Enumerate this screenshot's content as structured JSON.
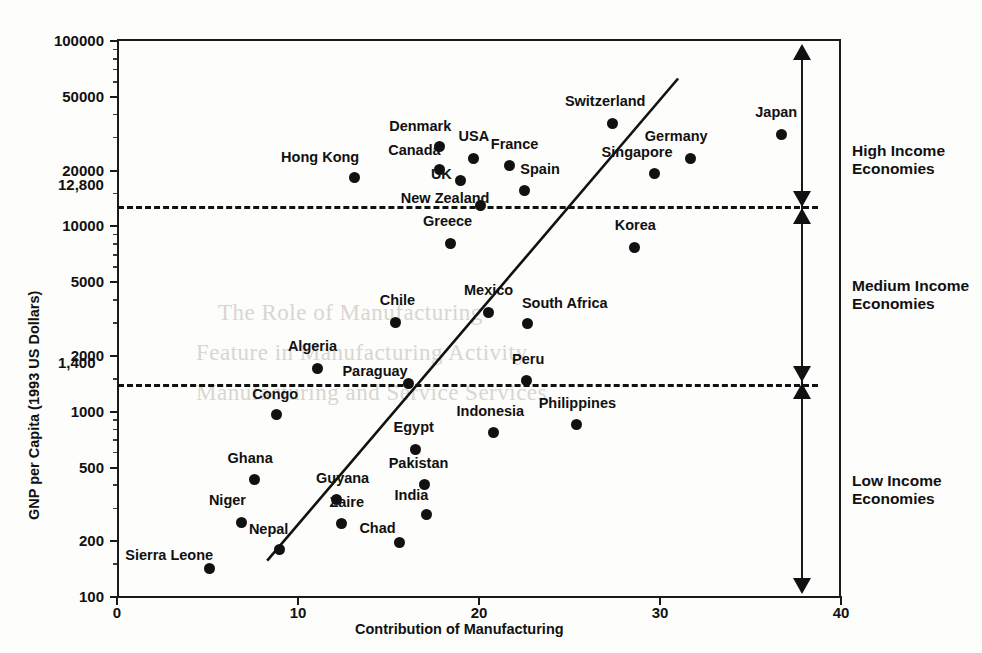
{
  "chart_data": {
    "type": "scatter",
    "title": "",
    "xlabel": "Contribution of Manufacturing",
    "ylabel": "GNP per Capita (1993 US Dollars)",
    "x_ticks": [
      "0",
      "10",
      "20",
      "30",
      "40"
    ],
    "x_tick_values": [
      0,
      10,
      20,
      30,
      40
    ],
    "xlim": [
      0,
      40
    ],
    "y_scale": "log",
    "y_ticks": [
      "100",
      "200",
      "500",
      "1000",
      "2000",
      "5000",
      "10000",
      "20000",
      "50000",
      "100000"
    ],
    "y_tick_values": [
      100,
      200,
      500,
      1000,
      2000,
      5000,
      10000,
      20000,
      50000,
      100000
    ],
    "ylim": [
      100,
      100000
    ],
    "grid": false,
    "legend": "none",
    "threshold_lines": [
      {
        "label": "12,800",
        "value": 12800
      },
      {
        "label": "1,400",
        "value": 1400
      }
    ],
    "trendline": {
      "x0": 8.3,
      "y0": 155,
      "x1": 31.0,
      "y1": 62000
    },
    "points": [
      {
        "label": "Japan",
        "x": 36.7,
        "y": 31000,
        "lx": -26,
        "ly": -22
      },
      {
        "label": "Switzerland",
        "x": 27.4,
        "y": 35500,
        "lx": -48,
        "ly": -22
      },
      {
        "label": "Germany",
        "x": 31.7,
        "y": 23000,
        "lx": -46,
        "ly": -22
      },
      {
        "label": "Singapore",
        "x": 29.7,
        "y": 19000,
        "lx": -53,
        "ly": -22
      },
      {
        "label": "Denmark",
        "x": 17.8,
        "y": 26500,
        "lx": -50,
        "ly": -21
      },
      {
        "label": "USA",
        "x": 19.7,
        "y": 23000,
        "lx": -15,
        "ly": -22
      },
      {
        "label": "France",
        "x": 21.7,
        "y": 21000,
        "lx": -19,
        "ly": -22
      },
      {
        "label": "Canada",
        "x": 17.8,
        "y": 20000,
        "lx": -51,
        "ly": -20
      },
      {
        "label": "UK",
        "x": 19.0,
        "y": 17500,
        "lx": -30,
        "ly": -6
      },
      {
        "label": "Spain",
        "x": 22.5,
        "y": 15500,
        "lx": -4,
        "ly": -21
      },
      {
        "label": "Hong Kong",
        "x": 13.1,
        "y": 18200,
        "lx": -73,
        "ly": -20
      },
      {
        "label": "New Zealand",
        "x": 20.1,
        "y": 12800,
        "lx": -80,
        "ly": -8
      },
      {
        "label": "Korea",
        "x": 28.6,
        "y": 7600,
        "lx": -20,
        "ly": -22
      },
      {
        "label": "Greece",
        "x": 18.4,
        "y": 8000,
        "lx": -27,
        "ly": -22
      },
      {
        "label": "Mexico",
        "x": 20.5,
        "y": 3400,
        "lx": -24,
        "ly": -22
      },
      {
        "label": "South Africa",
        "x": 22.7,
        "y": 2950,
        "lx": -6,
        "ly": -21
      },
      {
        "label": "Chile",
        "x": 15.4,
        "y": 3000,
        "lx": -16,
        "ly": -22
      },
      {
        "label": "Algeria",
        "x": 11.1,
        "y": 1700,
        "lx": -30,
        "ly": -22
      },
      {
        "label": "Peru",
        "x": 22.6,
        "y": 1450,
        "lx": -14,
        "ly": -22
      },
      {
        "label": "Paraguay",
        "x": 16.1,
        "y": 1400,
        "lx": -66,
        "ly": -13
      },
      {
        "label": "Congo",
        "x": 8.8,
        "y": 950,
        "lx": -24,
        "ly": -21
      },
      {
        "label": "Philippines",
        "x": 25.4,
        "y": 840,
        "lx": -38,
        "ly": -22
      },
      {
        "label": "Indonesia",
        "x": 20.8,
        "y": 760,
        "lx": -37,
        "ly": -22
      },
      {
        "label": "Egypt",
        "x": 16.5,
        "y": 620,
        "lx": -22,
        "ly": -22
      },
      {
        "label": "Ghana",
        "x": 7.6,
        "y": 425,
        "lx": -27,
        "ly": -22
      },
      {
        "label": "Pakistan",
        "x": 17.0,
        "y": 400,
        "lx": -36,
        "ly": -21
      },
      {
        "label": "Guyana",
        "x": 12.1,
        "y": 330,
        "lx": -20,
        "ly": -22
      },
      {
        "label": "Zaire",
        "x": 12.4,
        "y": 245,
        "lx": -12,
        "ly": -22
      },
      {
        "label": "India",
        "x": 17.1,
        "y": 275,
        "lx": -32,
        "ly": -20
      },
      {
        "label": "Niger",
        "x": 6.9,
        "y": 250,
        "lx": -33,
        "ly": -22
      },
      {
        "label": "Chad",
        "x": 15.6,
        "y": 195,
        "lx": -40,
        "ly": -14
      },
      {
        "label": "Nepal",
        "x": 9.0,
        "y": 178,
        "lx": -31,
        "ly": -21
      },
      {
        "label": "Sierra Leone",
        "x": 5.1,
        "y": 140,
        "lx": -84,
        "ly": -14
      }
    ]
  },
  "bands": [
    {
      "id": "high",
      "line1": "High Income",
      "line2": "Economies"
    },
    {
      "id": "medium",
      "line1": "Medium Income",
      "line2": "Economies"
    },
    {
      "id": "low",
      "line1": "Low Income",
      "line2": "Economies"
    }
  ],
  "ghost_text": [
    "The Role of Manufacturing",
    "Feature in Manufacturing Activity",
    "Manufacturing and Service Services"
  ]
}
